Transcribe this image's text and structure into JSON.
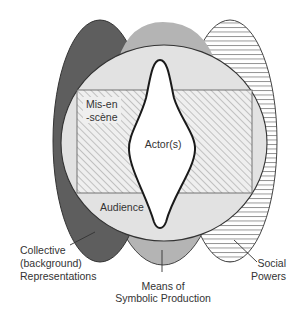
{
  "diagram": {
    "type": "nested-overlapping-shapes",
    "labels": {
      "actors": "Actor(s)",
      "mise_en_scene_line1": "Mis-en",
      "mise_en_scene_line2": "-scène",
      "audience": "Audience",
      "collective_line1": "Collective",
      "collective_line2": "(background)",
      "collective_line3": "Representations",
      "means_line1": "Means of",
      "means_line2": "Symbolic Production",
      "social_line1": "Social",
      "social_line2": "Powers"
    },
    "colors": {
      "collective_fill": "#5e5e5e",
      "means_fill": "#b4b4b4",
      "social_fill": "#ffffff",
      "audience_fill": "#e2e2e2",
      "mise_en_scene_fill": "#ececec",
      "actor_fill": "#ffffff",
      "stroke": "#2a2a2a"
    }
  }
}
